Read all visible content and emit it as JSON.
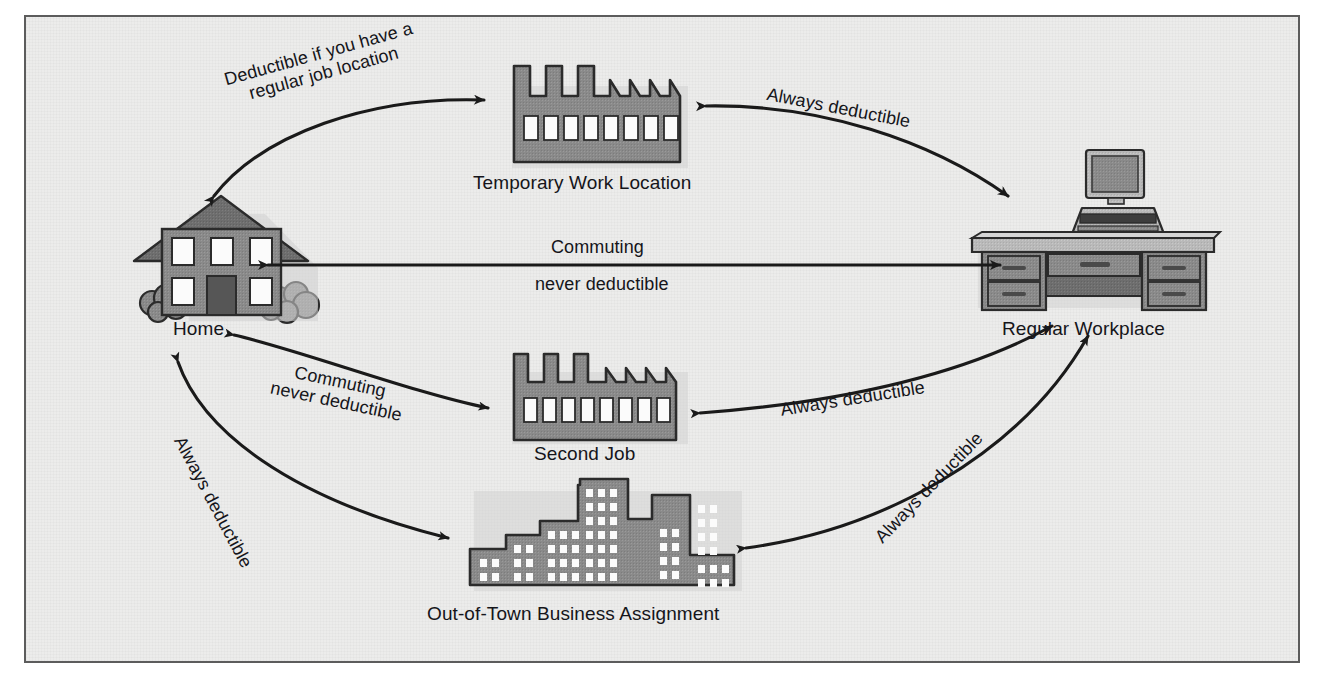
{
  "diagram": {
    "background_color": "#ececeb",
    "border_color": "#5c5c5c",
    "icon_fill": "#8a8a8a",
    "icon_dark": "#6a6a6a",
    "icon_outline": "#2b2b2b",
    "arrow_color": "#1a1a1a"
  },
  "nodes": [
    {
      "id": "home",
      "label": "Home",
      "icon": "house-icon"
    },
    {
      "id": "temp",
      "label": "Temporary Work Location",
      "icon": "factory-icon"
    },
    {
      "id": "work",
      "label": "Regular Workplace",
      "icon": "desk-computer-icon"
    },
    {
      "id": "second",
      "label": "Second Job",
      "icon": "factory-icon"
    },
    {
      "id": "outoftown",
      "label": "Out-of-Town Business Assignment",
      "icon": "city-skyline-icon"
    }
  ],
  "edges": [
    {
      "id": "home-temp",
      "from": "home",
      "to": "temp",
      "direction": "both",
      "label_line1": "Deductible if you have a",
      "label_line2": "regular job location"
    },
    {
      "id": "temp-work",
      "from": "temp",
      "to": "work",
      "direction": "both",
      "label_line1": "Always deductible",
      "label_line2": ""
    },
    {
      "id": "home-work",
      "from": "home",
      "to": "work",
      "direction": "both",
      "label_line1": "Commuting",
      "label_line2": "never deductible"
    },
    {
      "id": "home-second",
      "from": "home",
      "to": "second",
      "direction": "both",
      "label_line1": "Commuting",
      "label_line2": "never deductible"
    },
    {
      "id": "second-work",
      "from": "second",
      "to": "work",
      "direction": "both",
      "label_line1": "Always deductible",
      "label_line2": ""
    },
    {
      "id": "home-outoftown",
      "from": "home",
      "to": "outoftown",
      "direction": "both",
      "label_line1": "Always deductible",
      "label_line2": ""
    },
    {
      "id": "outoftown-work",
      "from": "outoftown",
      "to": "work",
      "direction": "both",
      "label_line1": "Always deductible",
      "label_line2": ""
    }
  ]
}
